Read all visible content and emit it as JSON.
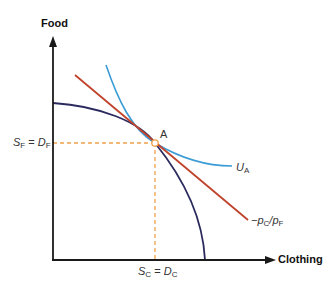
{
  "diagram": {
    "y_axis_label": "Food",
    "x_axis_label": "Clothing",
    "point_label": "A",
    "food_eq": {
      "left": "S",
      "left_sub": "F",
      "eq": " = ",
      "right": "D",
      "right_sub": "F"
    },
    "clothing_eq": {
      "left": "S",
      "left_sub": "C",
      "eq": " = ",
      "right": "D",
      "right_sub": "C"
    },
    "indifference_label": {
      "main": "U",
      "sub": "A"
    },
    "price_line_label": {
      "prefix": "−p",
      "sub1": "C",
      "slash": "/p",
      "sub2": "F"
    },
    "colors": {
      "axis": "#1a1a1a",
      "ppf": "#2b2a5e",
      "price_line": "#c0432b",
      "indifference": "#3b9bd6",
      "guide": "#f0a04b"
    }
  }
}
